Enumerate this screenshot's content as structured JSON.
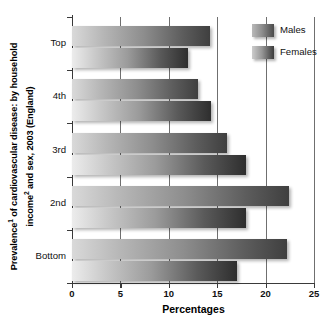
{
  "chart_data": {
    "type": "bar",
    "orientation": "horizontal",
    "title_line1": "Prevalence¹ of cardiovascular disease: by household",
    "title_line2": "income² and sex, 2003 (England)",
    "xlabel": "Percentages",
    "ylabel": "",
    "categories": [
      "Top",
      "4th",
      "3rd",
      "2nd",
      "Bottom"
    ],
    "series": [
      {
        "name": "Males",
        "values": [
          14.2,
          13.0,
          16.0,
          22.4,
          22.2
        ]
      },
      {
        "name": "Females",
        "values": [
          12.0,
          14.4,
          18.0,
          18.0,
          17.0
        ]
      }
    ],
    "xlim": [
      0,
      25
    ],
    "xticks": [
      0,
      5,
      10,
      15,
      20,
      25
    ],
    "xtick_labels": [
      "0",
      "5",
      "10",
      "15",
      "20",
      "25"
    ],
    "grid": true,
    "grid_axis": "x",
    "legend_position": "top-right",
    "legend_entries": [
      "Males",
      "Females"
    ],
    "footnote": ""
  },
  "legend": {
    "males_label": "Males",
    "females_label": "Females"
  },
  "axis": {
    "x_label": "Percentages"
  },
  "colors": {
    "males_light": "#d9d9d9",
    "males_dark": "#3f3f3f",
    "females_light": "#ececec",
    "females_dark": "#2e2e2e",
    "axis": "#3a3a3a",
    "grid": "#6f6f6f",
    "text": "#111111"
  }
}
